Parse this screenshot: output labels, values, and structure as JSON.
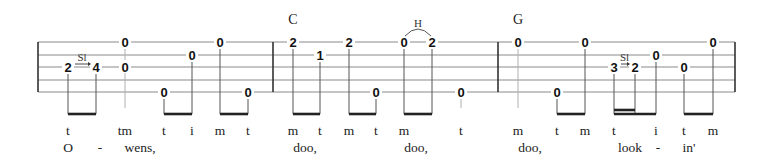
{
  "tab": {
    "staff": {
      "left": 38,
      "right": 735,
      "line_y": [
        42,
        55,
        67,
        80,
        92
      ],
      "barlines_x": [
        38,
        273,
        498,
        735
      ]
    },
    "chords": [
      {
        "label": "C",
        "x": 293
      },
      {
        "label": "G",
        "x": 518
      }
    ],
    "notes": [
      {
        "fret": "2",
        "string": 3,
        "x": 68
      },
      {
        "fret": "4",
        "string": 3,
        "x": 96
      },
      {
        "fret": "0",
        "string": 1,
        "x": 125
      },
      {
        "fret": "0",
        "string": 3,
        "x": 125
      },
      {
        "fret": "0",
        "string": 5,
        "x": 164
      },
      {
        "fret": "0",
        "string": 2,
        "x": 192
      },
      {
        "fret": "0",
        "string": 1,
        "x": 220
      },
      {
        "fret": "0",
        "string": 5,
        "x": 248
      },
      {
        "fret": "2",
        "string": 1,
        "x": 293
      },
      {
        "fret": "1",
        "string": 2,
        "x": 320
      },
      {
        "fret": "2",
        "string": 1,
        "x": 349
      },
      {
        "fret": "0",
        "string": 5,
        "x": 376
      },
      {
        "fret": "0",
        "string": 1,
        "x": 404
      },
      {
        "fret": "2",
        "string": 1,
        "x": 432
      },
      {
        "fret": "0",
        "string": 5,
        "x": 461
      },
      {
        "fret": "0",
        "string": 1,
        "x": 518
      },
      {
        "fret": "0",
        "string": 5,
        "x": 557
      },
      {
        "fret": "0",
        "string": 1,
        "x": 585
      },
      {
        "fret": "3",
        "string": 3,
        "x": 614
      },
      {
        "fret": "2",
        "string": 3,
        "x": 635
      },
      {
        "fret": "0",
        "string": 2,
        "x": 656
      },
      {
        "fret": "0",
        "string": 3,
        "x": 684
      },
      {
        "fret": "0",
        "string": 1,
        "x": 713
      }
    ],
    "stems": [
      {
        "x": 68,
        "from_string": 3,
        "light": false
      },
      {
        "x": 96,
        "from_string": 3,
        "light": false
      },
      {
        "x": 125,
        "from_string": 1,
        "light": true
      },
      {
        "x": 164,
        "from_string": 5,
        "light": false
      },
      {
        "x": 192,
        "from_string": 2,
        "light": false
      },
      {
        "x": 220,
        "from_string": 1,
        "light": false
      },
      {
        "x": 248,
        "from_string": 5,
        "light": false
      },
      {
        "x": 293,
        "from_string": 1,
        "light": false
      },
      {
        "x": 320,
        "from_string": 2,
        "light": false
      },
      {
        "x": 349,
        "from_string": 1,
        "light": false
      },
      {
        "x": 376,
        "from_string": 5,
        "light": false
      },
      {
        "x": 404,
        "from_string": 1,
        "light": false
      },
      {
        "x": 432,
        "from_string": 1,
        "light": false
      },
      {
        "x": 461,
        "from_string": 5,
        "light": true
      },
      {
        "x": 518,
        "from_string": 1,
        "light": true
      },
      {
        "x": 557,
        "from_string": 5,
        "light": false
      },
      {
        "x": 585,
        "from_string": 1,
        "light": false
      },
      {
        "x": 614,
        "from_string": 3,
        "light": false
      },
      {
        "x": 635,
        "from_string": 3,
        "light": false
      },
      {
        "x": 656,
        "from_string": 2,
        "light": false
      },
      {
        "x": 684,
        "from_string": 3,
        "light": false
      },
      {
        "x": 713,
        "from_string": 1,
        "light": false
      }
    ],
    "stem_bottom": 114,
    "light_stem_bottom": 108,
    "beams": [
      {
        "x1": 68,
        "x2": 96,
        "y": 114
      },
      {
        "x1": 164,
        "x2": 192,
        "y": 114
      },
      {
        "x1": 220,
        "x2": 248,
        "y": 114
      },
      {
        "x1": 293,
        "x2": 320,
        "y": 114
      },
      {
        "x1": 349,
        "x2": 376,
        "y": 114
      },
      {
        "x1": 404,
        "x2": 432,
        "y": 114
      },
      {
        "x1": 557,
        "x2": 585,
        "y": 114
      },
      {
        "x1": 614,
        "x2": 656,
        "y": 114
      },
      {
        "x1": 614,
        "x2": 635,
        "y": 110
      },
      {
        "x1": 684,
        "x2": 713,
        "y": 114
      }
    ],
    "slides": [
      {
        "label": "Sl",
        "x1": 68,
        "x2": 96,
        "string": 3
      },
      {
        "label": "Sl",
        "x1": 614,
        "x2": 635,
        "string": 3
      }
    ],
    "hammer_ons": [
      {
        "label": "H",
        "x1": 404,
        "x2": 432
      }
    ],
    "fingerings": [
      {
        "text": "t",
        "x": 68
      },
      {
        "text": "tm",
        "x": 125
      },
      {
        "text": "t",
        "x": 164
      },
      {
        "text": "i",
        "x": 192
      },
      {
        "text": "m",
        "x": 220
      },
      {
        "text": "t",
        "x": 248
      },
      {
        "text": "m",
        "x": 293
      },
      {
        "text": "t",
        "x": 320
      },
      {
        "text": "m",
        "x": 349
      },
      {
        "text": "t",
        "x": 376
      },
      {
        "text": "m",
        "x": 404
      },
      {
        "text": "t",
        "x": 461
      },
      {
        "text": "m",
        "x": 518
      },
      {
        "text": "t",
        "x": 557
      },
      {
        "text": "m",
        "x": 585
      },
      {
        "text": "t",
        "x": 614
      },
      {
        "text": "i",
        "x": 656
      },
      {
        "text": "t",
        "x": 684
      },
      {
        "text": "m",
        "x": 713
      }
    ],
    "lyrics": [
      {
        "text": "O",
        "x": 68
      },
      {
        "text": "-",
        "x": 100
      },
      {
        "text": "wens,",
        "x": 140
      },
      {
        "text": "doo,",
        "x": 305
      },
      {
        "text": "doo,",
        "x": 416
      },
      {
        "text": "doo,",
        "x": 530
      },
      {
        "text": "look",
        "x": 630
      },
      {
        "text": "-",
        "x": 658
      },
      {
        "text": "in'",
        "x": 689
      }
    ],
    "fingering_y": 135,
    "lyric_y": 152
  }
}
